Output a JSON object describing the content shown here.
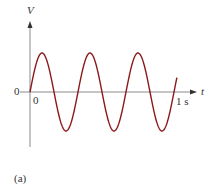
{
  "chart_data": {
    "type": "line",
    "title": "",
    "xlabel": "t",
    "ylabel": "V",
    "x_ticks": [
      "0",
      "1 s"
    ],
    "y_ticks": [
      "0"
    ],
    "series": [
      {
        "name": "V(t)",
        "function": "sin(2*pi*3*t)",
        "frequency_hz": 3,
        "cycles_shown": 3,
        "x_range": [
          0,
          1
        ],
        "amplitude": 1,
        "color": "#8b1a1a"
      }
    ],
    "xlim": [
      0,
      1
    ],
    "grid": false,
    "legend": "none",
    "caption": "(a)"
  },
  "labels": {
    "y_axis": "V",
    "x_axis": "t",
    "origin_y": "0",
    "origin_x": "0",
    "end_time": "1 s",
    "caption": "(a)"
  },
  "colors": {
    "curve": "#8b1a1a",
    "axis": "#888888",
    "text": "#333333"
  }
}
